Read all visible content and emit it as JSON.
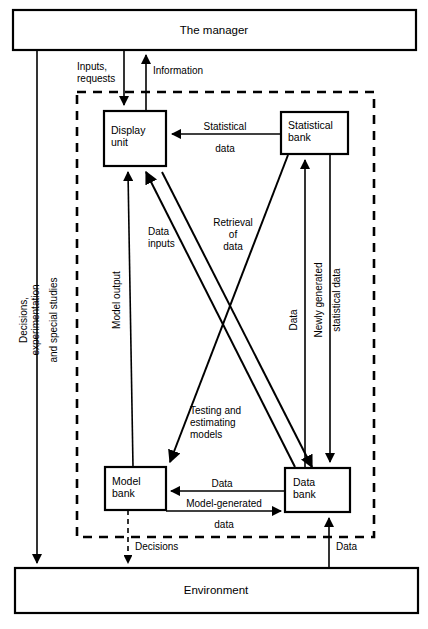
{
  "diagram": {
    "title": "The manager",
    "nodes": {
      "manager": "The manager",
      "environment": "Environment",
      "display_unit_line1": "Display",
      "display_unit_line2": "unit",
      "statistical_bank_line1": "Statistical",
      "statistical_bank_line2": "bank",
      "model_bank_line1": "Model",
      "model_bank_line2": "bank",
      "data_bank_line1": "Data",
      "data_bank_line2": "bank"
    },
    "edges": {
      "inputs_requests_line1": "Inputs,",
      "inputs_requests_line2": "requests",
      "information": "Information",
      "statistical_data_line1": "Statistical",
      "statistical_data_line2": "data",
      "decisions_experimentation_line1": "Decisions,",
      "decisions_experimentation_line2": "experimentation",
      "decisions_experimentation_line3": "and special studies",
      "model_output": "Model output",
      "data_inputs_line1": "Data",
      "data_inputs_line2": "inputs",
      "retrieval_of_data_line1": "Retrieval",
      "retrieval_of_data_line2": "of",
      "retrieval_of_data_line3": "data",
      "data_vertical": "Data",
      "newly_generated_line1": "Newly generated",
      "newly_generated_line2": "statistical data",
      "testing_estimating_line1": "Testing and",
      "testing_estimating_line2": "estimating",
      "testing_estimating_line3": "models",
      "data_between_banks": "Data",
      "model_generated_line1": "Model-generated",
      "model_generated_line2": "data",
      "decisions_bottom": "Decisions",
      "data_bottom": "Data"
    },
    "colors": {
      "stroke": "#000000",
      "fill": "#ffffff"
    }
  }
}
